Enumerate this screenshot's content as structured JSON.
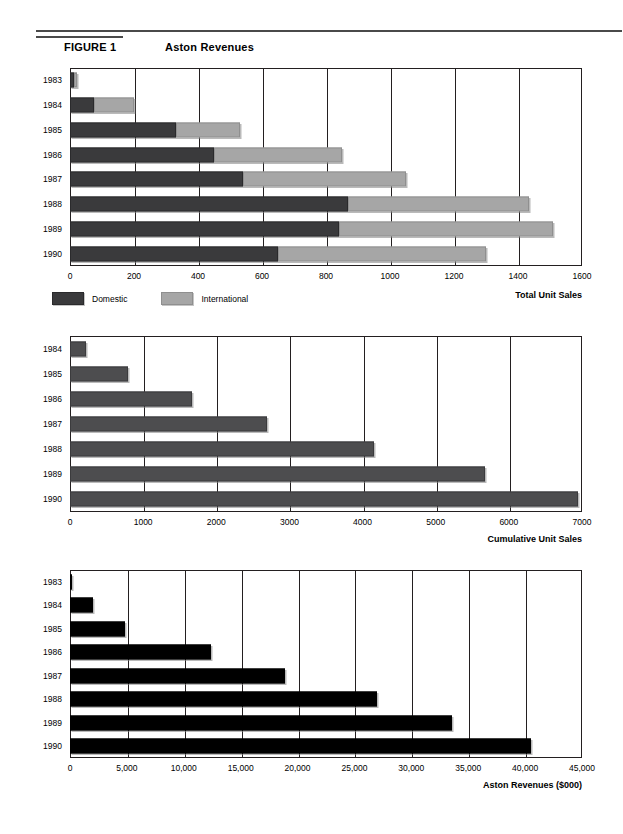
{
  "header": {
    "figure_label": "FIGURE 1",
    "figure_title": "Aston Revenues"
  },
  "legend": {
    "domestic_label": "Domestic",
    "international_label": "International",
    "domestic_color": "#3a3a3c",
    "international_color": "#a6a6a6"
  },
  "charts": [
    {
      "id": "total-unit-sales",
      "xtitle": "Total Unit Sales",
      "ticks": [
        "0",
        "200",
        "400",
        "600",
        "800",
        "1000",
        "1200",
        "1400",
        "1600"
      ],
      "years": [
        "1983",
        "1984",
        "1985",
        "1986",
        "1987",
        "1988",
        "1989",
        "1990"
      ]
    },
    {
      "id": "cumulative-unit-sales",
      "xtitle": "Cumulative Unit Sales",
      "ticks": [
        "0",
        "1000",
        "2000",
        "3000",
        "4000",
        "5000",
        "6000",
        "7000"
      ],
      "years": [
        "1984",
        "1985",
        "1986",
        "1987",
        "1988",
        "1989",
        "1990"
      ]
    },
    {
      "id": "aston-revenues",
      "xtitle": "Aston Revenues ($000)",
      "ticks": [
        "0",
        "5,000",
        "10,000",
        "15,000",
        "20,000",
        "25,000",
        "30,000",
        "35,000",
        "40,000",
        "45,000"
      ],
      "years": [
        "1983",
        "1984",
        "1985",
        "1986",
        "1987",
        "1988",
        "1989",
        "1990"
      ]
    }
  ],
  "chart_data": [
    {
      "type": "bar",
      "orientation": "horizontal",
      "stacked": true,
      "title": "Total Unit Sales",
      "xlabel": "Total Unit Sales",
      "ylabel": "",
      "xlim": [
        0,
        1600
      ],
      "xticks": [
        0,
        200,
        400,
        600,
        800,
        1000,
        1200,
        1400,
        1600
      ],
      "grid": true,
      "legend": [
        "Domestic",
        "International"
      ],
      "legend_position": "below-left",
      "categories": [
        "1983",
        "1984",
        "1985",
        "1986",
        "1987",
        "1988",
        "1989",
        "1990"
      ],
      "series": [
        {
          "name": "Domestic",
          "color": "#3a3a3c",
          "values": [
            12,
            75,
            330,
            450,
            540,
            870,
            840,
            650
          ]
        },
        {
          "name": "International",
          "color": "#a6a6a6",
          "values": [
            10,
            125,
            200,
            400,
            510,
            565,
            670,
            650
          ]
        }
      ],
      "totals": [
        22,
        200,
        530,
        850,
        1050,
        1435,
        1510,
        1300
      ]
    },
    {
      "type": "bar",
      "orientation": "horizontal",
      "stacked": false,
      "title": "Cumulative Unit Sales",
      "xlabel": "Cumulative Unit Sales",
      "ylabel": "",
      "xlim": [
        0,
        7000
      ],
      "xticks": [
        0,
        1000,
        2000,
        3000,
        4000,
        5000,
        6000,
        7000
      ],
      "grid": true,
      "categories": [
        "1984",
        "1985",
        "1986",
        "1987",
        "1988",
        "1989",
        "1990"
      ],
      "series": [
        {
          "name": "Cumulative Unit Sales",
          "color": "#4d4d4f",
          "values": [
            220,
            790,
            1670,
            2700,
            4150,
            5670,
            6950
          ]
        }
      ]
    },
    {
      "type": "bar",
      "orientation": "horizontal",
      "stacked": false,
      "title": "Aston Revenues ($000)",
      "xlabel": "Aston Revenues ($000)",
      "ylabel": "",
      "xlim": [
        0,
        45000
      ],
      "xticks": [
        0,
        5000,
        10000,
        15000,
        20000,
        25000,
        30000,
        35000,
        40000,
        45000
      ],
      "grid": true,
      "categories": [
        "1983",
        "1984",
        "1985",
        "1986",
        "1987",
        "1988",
        "1989",
        "1990"
      ],
      "series": [
        {
          "name": "Aston Revenues ($000)",
          "color": "#000000",
          "values": [
            200,
            2000,
            4800,
            12400,
            18900,
            27000,
            33600,
            40500
          ]
        }
      ]
    }
  ]
}
